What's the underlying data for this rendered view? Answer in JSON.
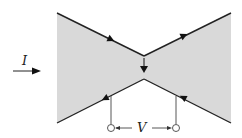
{
  "diagram": {
    "type": "constriction-edge-channels",
    "current_label": "I",
    "voltage_label": "V",
    "colors": {
      "fill": "#d9d9d9",
      "line": "#222222",
      "background": "#ffffff"
    },
    "edges": [
      {
        "name": "top-left-edge",
        "arrow_direction": "toward-constriction"
      },
      {
        "name": "top-right-edge",
        "arrow_direction": "away-from-constriction"
      },
      {
        "name": "bottom-left-edge",
        "arrow_direction": "away-from-constriction"
      },
      {
        "name": "bottom-right-edge",
        "arrow_direction": "toward-constriction"
      },
      {
        "name": "constriction",
        "arrow_direction": "downward"
      }
    ],
    "terminals": 2
  }
}
